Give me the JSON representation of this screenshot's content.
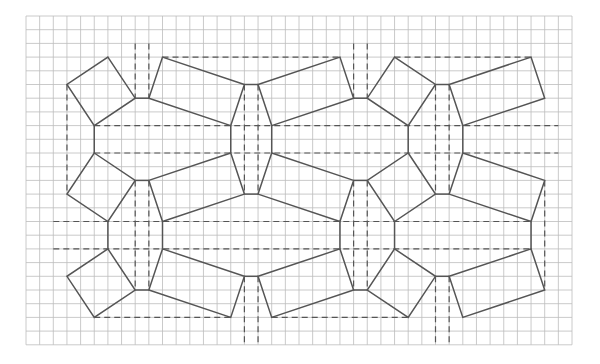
{
  "diagram": {
    "grid": {
      "x0": 26,
      "y0": 16,
      "dx": 13.65,
      "dy": 13.7,
      "cols": 40,
      "rows": 24,
      "color": "#bdbdbd"
    },
    "stroke_color": "#555555",
    "squares": [
      [
        [
          6,
          3
        ],
        [
          8,
          6
        ],
        [
          5,
          8
        ],
        [
          3,
          5
        ]
      ],
      [
        [
          27,
          3
        ],
        [
          30,
          5
        ],
        [
          28,
          8
        ],
        [
          25,
          6
        ]
      ],
      [
        [
          5,
          10
        ],
        [
          8,
          12
        ],
        [
          6,
          15
        ],
        [
          3,
          13
        ]
      ],
      [
        [
          28,
          10
        ],
        [
          30,
          13
        ],
        [
          27,
          15
        ],
        [
          25,
          12
        ]
      ],
      [
        [
          6,
          17
        ],
        [
          8,
          20
        ],
        [
          5,
          22
        ],
        [
          3,
          19
        ]
      ],
      [
        [
          27,
          17
        ],
        [
          30,
          19
        ],
        [
          28,
          22
        ],
        [
          25,
          20
        ]
      ]
    ],
    "rectangles": [
      [
        [
          10,
          3
        ],
        [
          16,
          5
        ],
        [
          15,
          8
        ],
        [
          9,
          6
        ]
      ],
      [
        [
          17,
          5
        ],
        [
          23,
          3
        ],
        [
          24,
          6
        ],
        [
          18,
          8
        ]
      ],
      [
        [
          31,
          5
        ],
        [
          37,
          3
        ],
        [
          38,
          6
        ],
        [
          32,
          8
        ]
      ],
      [
        [
          9,
          12
        ],
        [
          15,
          10
        ],
        [
          16,
          13
        ],
        [
          10,
          15
        ]
      ],
      [
        [
          18,
          10
        ],
        [
          24,
          12
        ],
        [
          23,
          15
        ],
        [
          17,
          13
        ]
      ],
      [
        [
          32,
          10
        ],
        [
          38,
          12
        ],
        [
          37,
          15
        ],
        [
          31,
          13
        ]
      ],
      [
        [
          10,
          17
        ],
        [
          16,
          19
        ],
        [
          15,
          22
        ],
        [
          9,
          20
        ]
      ],
      [
        [
          17,
          19
        ],
        [
          23,
          17
        ],
        [
          24,
          20
        ],
        [
          18,
          22
        ]
      ],
      [
        [
          31,
          19
        ],
        [
          37,
          17
        ],
        [
          38,
          20
        ],
        [
          32,
          22
        ]
      ]
    ],
    "connectors": [
      [
        [
          8,
          6
        ],
        [
          9,
          6
        ]
      ],
      [
        [
          16,
          5
        ],
        [
          17,
          5
        ]
      ],
      [
        [
          24,
          6
        ],
        [
          25,
          6
        ]
      ],
      [
        [
          30,
          5
        ],
        [
          31,
          5
        ]
      ],
      [
        [
          5,
          8
        ],
        [
          5,
          10
        ]
      ],
      [
        [
          15,
          8
        ],
        [
          15,
          10
        ]
      ],
      [
        [
          18,
          8
        ],
        [
          18,
          10
        ]
      ],
      [
        [
          28,
          8
        ],
        [
          28,
          10
        ]
      ],
      [
        [
          32,
          8
        ],
        [
          32,
          10
        ]
      ],
      [
        [
          8,
          12
        ],
        [
          9,
          12
        ]
      ],
      [
        [
          16,
          13
        ],
        [
          17,
          13
        ]
      ],
      [
        [
          24,
          12
        ],
        [
          25,
          12
        ]
      ],
      [
        [
          30,
          13
        ],
        [
          31,
          13
        ]
      ],
      [
        [
          6,
          15
        ],
        [
          6,
          17
        ]
      ],
      [
        [
          10,
          15
        ],
        [
          10,
          17
        ]
      ],
      [
        [
          23,
          15
        ],
        [
          23,
          17
        ]
      ],
      [
        [
          27,
          15
        ],
        [
          27,
          17
        ]
      ],
      [
        [
          37,
          15
        ],
        [
          37,
          17
        ]
      ],
      [
        [
          8,
          20
        ],
        [
          9,
          20
        ]
      ],
      [
        [
          16,
          19
        ],
        [
          17,
          19
        ]
      ],
      [
        [
          24,
          20
        ],
        [
          25,
          20
        ]
      ],
      [
        [
          30,
          19
        ],
        [
          31,
          19
        ]
      ]
    ],
    "dashed": [
      [
        [
          10,
          3
        ],
        [
          23,
          3
        ]
      ],
      [
        [
          27,
          3
        ],
        [
          37,
          3
        ]
      ],
      [
        [
          5,
          8
        ],
        [
          39,
          8
        ]
      ],
      [
        [
          5,
          10
        ],
        [
          39,
          10
        ]
      ],
      [
        [
          2,
          15
        ],
        [
          37,
          15
        ]
      ],
      [
        [
          2,
          17
        ],
        [
          37,
          17
        ]
      ],
      [
        [
          5,
          22
        ],
        [
          15,
          22
        ]
      ],
      [
        [
          18,
          22
        ],
        [
          28,
          22
        ]
      ],
      [
        [
          8,
          2
        ],
        [
          8,
          6
        ]
      ],
      [
        [
          9,
          2
        ],
        [
          9,
          6
        ]
      ],
      [
        [
          24,
          2
        ],
        [
          24,
          6
        ]
      ],
      [
        [
          25,
          2
        ],
        [
          25,
          6
        ]
      ],
      [
        [
          3,
          5
        ],
        [
          3,
          13
        ]
      ],
      [
        [
          16,
          5
        ],
        [
          16,
          13
        ]
      ],
      [
        [
          17,
          5
        ],
        [
          17,
          13
        ]
      ],
      [
        [
          30,
          5
        ],
        [
          30,
          13
        ]
      ],
      [
        [
          31,
          5
        ],
        [
          31,
          13
        ]
      ],
      [
        [
          8,
          12
        ],
        [
          8,
          20
        ]
      ],
      [
        [
          9,
          12
        ],
        [
          9,
          20
        ]
      ],
      [
        [
          24,
          12
        ],
        [
          24,
          20
        ]
      ],
      [
        [
          25,
          12
        ],
        [
          25,
          20
        ]
      ],
      [
        [
          38,
          12
        ],
        [
          38,
          20
        ]
      ],
      [
        [
          16,
          19
        ],
        [
          16,
          24
        ]
      ],
      [
        [
          17,
          19
        ],
        [
          17,
          24
        ]
      ],
      [
        [
          30,
          19
        ],
        [
          30,
          24
        ]
      ],
      [
        [
          31,
          19
        ],
        [
          31,
          24
        ]
      ]
    ]
  }
}
